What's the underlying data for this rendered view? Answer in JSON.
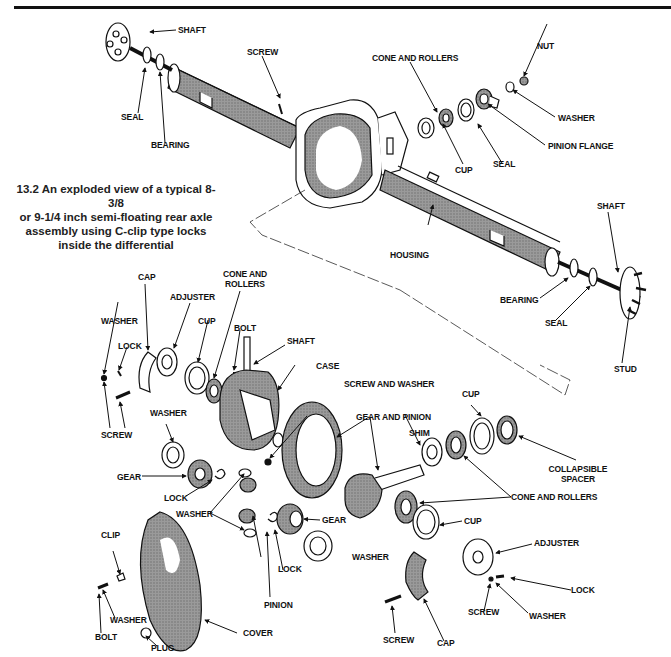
{
  "figure": {
    "number": "13.2",
    "caption": "13.2 An exploded view of a typical 8-3/8 or 9-1/4 inch semi-floating rear axle assembly using C-clip type locks inside the differential",
    "caption_lines": [
      "13.2  An exploded view of a typical 8-3/8",
      "or 9-1/4 inch semi-floating rear axle",
      "assembly using C-clip type locks",
      "inside the differential"
    ]
  },
  "labels": {
    "axle_left": {
      "shaft": "SHAFT",
      "seal": "SEAL",
      "bearing": "BEARING"
    },
    "housing_top": {
      "screw": "SCREW"
    },
    "pinion_top": {
      "cone_and_rollers": "CONE AND ROLLERS",
      "cup": "CUP",
      "seal": "SEAL",
      "nut": "NUT",
      "washer": "WASHER",
      "pinion_flange": "PINION FLANGE"
    },
    "housing": "HOUSING",
    "axle_right": {
      "shaft": "SHAFT",
      "bearing": "BEARING",
      "seal": "SEAL",
      "stud": "STUD"
    },
    "diff_left": {
      "cap": "CAP",
      "adjuster": "ADJUSTER",
      "cone_and_rollers_1": "CONE AND",
      "cone_and_rollers_2": "ROLLERS",
      "washer": "WASHER",
      "lock": "LOCK",
      "cup": "CUP",
      "bolt": "BOLT",
      "shaft": "SHAFT",
      "case": "CASE",
      "screw": "SCREW",
      "screw_and_washer": "SCREW AND WASHER"
    },
    "diff_gears": {
      "washer_top": "WASHER",
      "gear_left": "GEAR",
      "lock_left": "LOCK",
      "washer_mid": "WASHER",
      "gear_right": "GEAR",
      "lock_right": "LOCK",
      "pinion": "PINION",
      "washer_right": "WASHER"
    },
    "pinion_assy": {
      "gear_and_pinion": "GEAR AND PINION",
      "shim": "SHIM",
      "cup_top": "CUP",
      "collapsible_spacer_1": "COLLAPSIBLE",
      "collapsible_spacer_2": "SPACER",
      "cone_and_rollers": "CONE AND ROLLERS",
      "cup_bottom": "CUP"
    },
    "right_cap": {
      "adjuster": "ADJUSTER",
      "lock": "LOCK",
      "screw_small": "SCREW",
      "washer": "WASHER",
      "screw": "SCREW",
      "cap": "CAP"
    },
    "cover_group": {
      "clip": "CLIP",
      "washer": "WASHER",
      "bolt": "BOLT",
      "plug": "PLUG",
      "cover": "COVER"
    }
  }
}
